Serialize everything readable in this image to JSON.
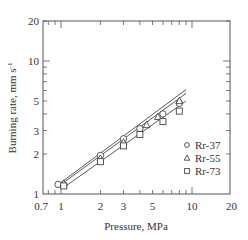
{
  "chart_data": {
    "type": "scatter",
    "title": "",
    "xlabel": "Pressure,  MPa",
    "ylabel": "Burning  rate,  mm s",
    "ylabel_superscript": "-1",
    "xscale": "log",
    "yscale": "log",
    "xlim": [
      0.7,
      20
    ],
    "ylim": [
      1,
      20
    ],
    "xticks": [
      0.7,
      1,
      2,
      3,
      5,
      10,
      20
    ],
    "xtick_labels": [
      "0.7",
      "1",
      "2",
      "3",
      "5",
      "10",
      "20"
    ],
    "yticks": [
      1,
      2,
      3,
      5,
      10,
      20
    ],
    "ytick_labels": [
      "1",
      "2",
      "3",
      "5",
      "10",
      "20"
    ],
    "grid": false,
    "legend_position": "lower right",
    "series": [
      {
        "name": "Rr-37",
        "marker": "circle",
        "x": [
          0.95,
          2,
          3,
          4,
          6,
          8
        ],
        "y": [
          1.18,
          1.95,
          2.6,
          3.1,
          4.0,
          4.8
        ],
        "fit_line": {
          "x": [
            1.0,
            9.0
          ],
          "y": [
            1.22,
            6.1
          ]
        }
      },
      {
        "name": "Rr-55",
        "marker": "triangle",
        "x": [
          1.05,
          2,
          3,
          4.5,
          5.5,
          8
        ],
        "y": [
          1.2,
          1.85,
          2.45,
          3.3,
          3.8,
          5.0
        ],
        "fit_line": {
          "x": [
            1.0,
            9.0
          ],
          "y": [
            1.18,
            5.7
          ]
        }
      },
      {
        "name": "Rr-73",
        "marker": "square",
        "x": [
          1.05,
          2,
          3,
          4,
          6,
          8
        ],
        "y": [
          1.15,
          1.75,
          2.3,
          2.8,
          3.5,
          4.2
        ],
        "fit_line": {
          "x": [
            1.05,
            9.0
          ],
          "y": [
            1.12,
            5.0
          ]
        }
      }
    ]
  },
  "colors": {
    "axis": "#555555",
    "line": "#444444",
    "marker": "#444444",
    "background": "#ffffff"
  }
}
